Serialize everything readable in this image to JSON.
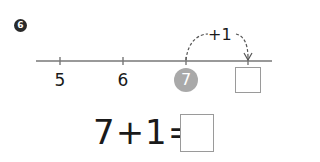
{
  "problem": {
    "number": "6",
    "number_line": {
      "labels": [
        "5",
        "6"
      ],
      "highlighted": "7",
      "jump_label": "+1",
      "answer_box": ""
    },
    "equation": {
      "expression": "7+1=",
      "answer_box": ""
    }
  },
  "colors": {
    "line": "#777777",
    "highlight_circle": "#a9a9a9",
    "text": "#1a1a1a"
  }
}
